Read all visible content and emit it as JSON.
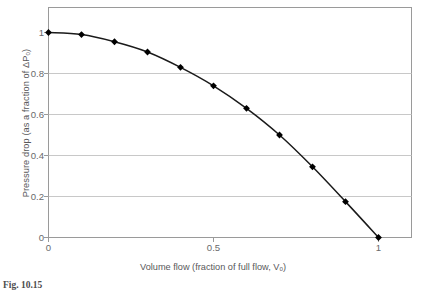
{
  "chart_data": {
    "type": "line",
    "title": "",
    "xlabel": "Volume flow (fraction of full flow, Vₒ)",
    "ylabel": "Pressure drop (as a fraction of ΔPₒ)",
    "xlim": [
      0,
      1.06
    ],
    "ylim": [
      0,
      1.06
    ],
    "grid": true,
    "grid_axis": "y",
    "legend": "none",
    "marker": "diamond",
    "x": [
      0,
      0.1,
      0.2,
      0.3,
      0.4,
      0.5,
      0.6,
      0.7,
      0.8,
      0.9,
      1.0
    ],
    "values": [
      1.0,
      0.99,
      0.955,
      0.905,
      0.83,
      0.74,
      0.63,
      0.5,
      0.345,
      0.175,
      0.0
    ],
    "series": [
      {
        "name": "Pressure drop",
        "values": [
          1.0,
          0.99,
          0.955,
          0.905,
          0.83,
          0.74,
          0.63,
          0.5,
          0.345,
          0.175,
          0.0
        ]
      }
    ],
    "xticks": [
      {
        "value": 0,
        "label": "0"
      },
      {
        "value": 0.5,
        "label": "0.5"
      },
      {
        "value": 1,
        "label": "1"
      }
    ],
    "yticks": [
      {
        "value": 0,
        "label": "0"
      },
      {
        "value": 0.2,
        "label": "0.2"
      },
      {
        "value": 0.4,
        "label": "0.4"
      },
      {
        "value": 0.6,
        "label": "0.6"
      },
      {
        "value": 0.8,
        "label": "0.8"
      },
      {
        "value": 1,
        "label": "1"
      }
    ],
    "colors": {
      "line": "#1a1a1a",
      "marker": "#000000",
      "grid": "#c8c8c8",
      "frame": "#9a9a9a",
      "text": "#58585a",
      "background": "#ffffff"
    }
  },
  "caption": {
    "text": "Fig. 10.15"
  }
}
